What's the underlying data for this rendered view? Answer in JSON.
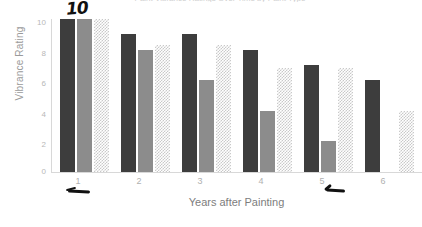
{
  "chart_data": {
    "type": "bar",
    "title": "Paint Vibrance Ratings Over Time by Paint Type",
    "xlabel": "Years after Painting",
    "ylabel": "Vibrance Rating",
    "categories": [
      "1",
      "2",
      "3",
      "4",
      "5",
      "6"
    ],
    "ylim": [
      0,
      10
    ],
    "yticks": [
      "0",
      "2",
      "4",
      "6",
      "8",
      "10"
    ],
    "grid": false,
    "legend": "none",
    "series": [
      {
        "name": "series-dark",
        "color": "#3d3d3d",
        "values": [
          10,
          9,
          9,
          8,
          7,
          6
        ]
      },
      {
        "name": "series-medium",
        "color": "#8c8c8c",
        "values": [
          10,
          8,
          6,
          4,
          2,
          0
        ]
      },
      {
        "name": "series-dotted",
        "color": "#c9c9c9",
        "values": [
          10,
          8.3,
          8.3,
          6.8,
          6.8,
          4
        ]
      }
    ]
  },
  "annotations": {
    "handwritten_ten": "10",
    "underline_group_1": "",
    "underline_group_5": ""
  }
}
